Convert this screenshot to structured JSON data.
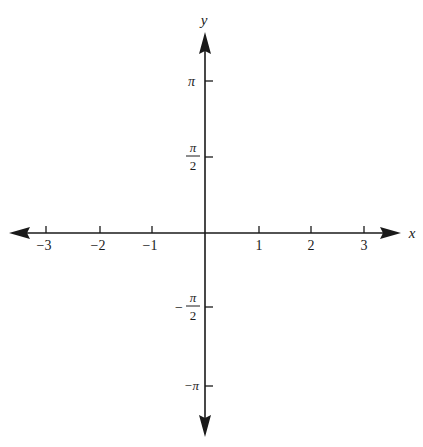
{
  "diagram": {
    "type": "cartesian-axes",
    "colors": {
      "ink": "#1a1a1a",
      "background": "#ffffff"
    },
    "axes": {
      "x": {
        "label": "x",
        "ticks": [
          {
            "value": -3,
            "label": "−3"
          },
          {
            "value": -2,
            "label": "−2"
          },
          {
            "value": -1,
            "label": "−1"
          },
          {
            "value": 1,
            "label": "1"
          },
          {
            "value": 2,
            "label": "2"
          },
          {
            "value": 3,
            "label": "3"
          }
        ],
        "arrows": "both"
      },
      "y": {
        "label": "y",
        "ticks": [
          {
            "value": "π",
            "label": "π"
          },
          {
            "value": "π/2",
            "numerator": "π",
            "denominator": "2",
            "sign": ""
          },
          {
            "value": "-π/2",
            "numerator": "π",
            "denominator": "2",
            "sign": "−"
          },
          {
            "value": "-π",
            "label": "−π"
          }
        ],
        "arrows": "both"
      }
    }
  }
}
